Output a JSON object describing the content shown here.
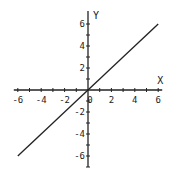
{
  "chart_data": {
    "type": "line",
    "title": "",
    "xlabel": "X",
    "ylabel": "Y",
    "xlim": [
      -6,
      6
    ],
    "ylim": [
      -7,
      7
    ],
    "grid": false,
    "legend": null,
    "x_tick_labels": [
      "-6",
      "-4",
      "-2",
      "0",
      "2",
      "4",
      "6"
    ],
    "y_tick_labels": [
      "6",
      "4",
      "2",
      "-2",
      "-4",
      "-6"
    ],
    "x_minor_ticks": [
      -6,
      -5,
      -4,
      -3,
      -2,
      -1,
      1,
      2,
      3,
      4,
      5,
      6
    ],
    "y_minor_ticks": [
      -7,
      -6,
      -5,
      -4,
      -3,
      -2,
      -1,
      1,
      2,
      3,
      4,
      5,
      6
    ],
    "series": [
      {
        "name": "y = x",
        "x": [
          -6,
          6
        ],
        "y": [
          -6,
          6
        ],
        "color": "#222222"
      }
    ]
  },
  "layout": {
    "origin_px": [
      88,
      90
    ],
    "unit_px_x": 11.7,
    "unit_px_y": 11.0
  }
}
